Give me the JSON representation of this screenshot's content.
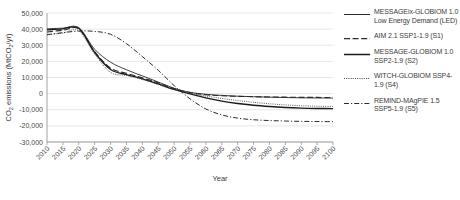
{
  "chart_data": {
    "type": "line",
    "title": "",
    "xlabel": "Year",
    "ylabel": "CO2 emissions (MtCO2/yr)",
    "ylabel_parts": {
      "pre": "CO",
      "sub1": "2",
      "mid": " emissions (MtCO",
      "sub2": "2",
      "post": "/yr)"
    },
    "grid": true,
    "legend_position": "right",
    "xlim": [
      2010,
      2100
    ],
    "ylim": [
      -30000,
      50000
    ],
    "ytick_step": 10000,
    "x": [
      2010,
      2015,
      2020,
      2025,
      2030,
      2035,
      2040,
      2045,
      2050,
      2055,
      2060,
      2065,
      2070,
      2075,
      2080,
      2085,
      2090,
      2095,
      2100
    ],
    "xticks": [
      "2010",
      "2015",
      "2020",
      "2025",
      "2030",
      "2035",
      "2040",
      "2045",
      "2050",
      "2055",
      "2060",
      "2065",
      "2070",
      "2075",
      "2080",
      "2085",
      "2090",
      "2095",
      "2100"
    ],
    "yticks": [
      "50,000",
      "40,000",
      "30,000",
      "20,000",
      "10,000",
      "0",
      "-10,000",
      "-20,000",
      "-30,000"
    ],
    "ytick_values": [
      50000,
      40000,
      30000,
      20000,
      10000,
      0,
      -10000,
      -20000,
      -30000
    ],
    "series": [
      {
        "name": "MESSAGEix-GLOBIOM 1.0 Low Energy Demand (LED)",
        "style": "solid-thin",
        "color": "#2b2b2b",
        "values": [
          40200,
          40600,
          40900,
          27500,
          19500,
          14800,
          11000,
          7200,
          3300,
          800,
          -400,
          -1100,
          -1600,
          -1900,
          -2200,
          -2400,
          -2600,
          -2700,
          -2800
        ]
      },
      {
        "name": "AIM 2.1 SSP1-1.9 (S1)",
        "style": "dashed",
        "color": "#2b2b2b",
        "values": [
          38200,
          39300,
          40100,
          26000,
          15800,
          12600,
          9800,
          6800,
          3100,
          600,
          -700,
          -1300,
          -1700,
          -1900,
          -2100,
          -2200,
          -2300,
          -2350,
          -2400
        ]
      },
      {
        "name": "MESSAGE-GLOBIOM 1.0 SSP2-1.9 (S2)",
        "style": "solid-thick",
        "color": "#1a1a1a",
        "values": [
          39500,
          40200,
          40500,
          25500,
          15000,
          11800,
          9200,
          6000,
          2600,
          -200,
          -2600,
          -4600,
          -6100,
          -7200,
          -8000,
          -8600,
          -9000,
          -9200,
          -9300
        ]
      },
      {
        "name": "WITCH-GLOBIOM SSP4-1.9 (S4)",
        "style": "dotted",
        "color": "#4a4a4a",
        "values": [
          36400,
          37600,
          38900,
          24500,
          13200,
          11200,
          8800,
          5600,
          2400,
          200,
          -1500,
          -3000,
          -4300,
          -5400,
          -6300,
          -7000,
          -7500,
          -7800,
          -8000
        ]
      },
      {
        "name": "REMIND-MAgPIE 1.5 SSP5-1.9 (S5)",
        "style": "dashdot",
        "color": "#2b2b2b",
        "values": [
          36600,
          37800,
          38800,
          38600,
          36800,
          31000,
          23000,
          14500,
          5000,
          -3200,
          -9500,
          -13200,
          -15200,
          -16200,
          -16700,
          -17000,
          -17200,
          -17300,
          -17400
        ]
      }
    ]
  },
  "legend": {
    "entries": [
      {
        "label": "MESSAGEix-GLOBIOM 1.0 Low Energy Demand (LED)"
      },
      {
        "label": "AIM 2.1 SSP1-1.9 (S1)"
      },
      {
        "label": "MESSAGE-GLOBIOM 1.0 SSP2-1.9 (S2)"
      },
      {
        "label": "WITCH-GLOBIOM SSP4-1.9 (S4)"
      },
      {
        "label": "REMIND-MAgPIE 1.5 SSP5-1.9 (S5)"
      }
    ]
  }
}
